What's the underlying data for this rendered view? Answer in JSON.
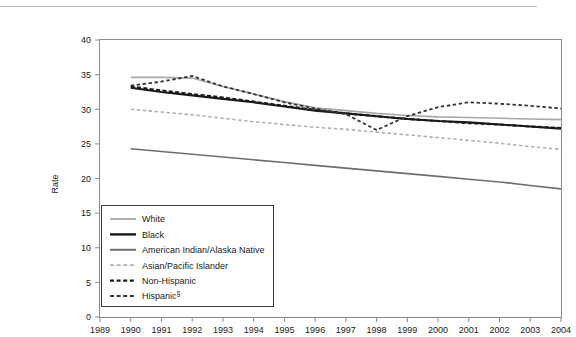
{
  "chart_data": {
    "type": "line",
    "title": "",
    "xlabel": "",
    "ylabel": "Rate",
    "xlim": [
      1989,
      2004
    ],
    "ylim": [
      0,
      40
    ],
    "yticks": [
      0,
      5,
      10,
      15,
      20,
      25,
      30,
      35,
      40
    ],
    "xticks": [
      1989,
      1990,
      1991,
      1992,
      1993,
      1994,
      1995,
      1996,
      1997,
      1998,
      1999,
      2000,
      2001,
      2002,
      2003,
      2004
    ],
    "grid": false,
    "legend_position": "lower-left-inside",
    "x": [
      1990,
      1991,
      1992,
      1993,
      1994,
      1995,
      1996,
      1997,
      1998,
      1999,
      2000,
      2001,
      2002,
      2003,
      2004
    ],
    "series": [
      {
        "name": "White",
        "color": "#a8a8a8",
        "style": "solid",
        "width": 1.6,
        "values": [
          34.6,
          34.6,
          34.5,
          33.3,
          32.2,
          31.1,
          30.2,
          29.8,
          29.4,
          29.1,
          28.9,
          28.8,
          28.7,
          28.6,
          28.5
        ]
      },
      {
        "name": "Black",
        "color": "#1a1a1a",
        "style": "solid",
        "width": 2.1,
        "values": [
          33.1,
          32.5,
          32.0,
          31.5,
          31.0,
          30.4,
          29.8,
          29.4,
          29.0,
          28.6,
          28.3,
          28.1,
          27.8,
          27.5,
          27.2
        ]
      },
      {
        "name": "American Indian/Alaska Native",
        "color": "#6e6e6e",
        "style": "solid",
        "width": 1.6,
        "values": [
          24.3,
          23.9,
          23.5,
          23.1,
          22.7,
          22.3,
          21.9,
          21.5,
          21.1,
          20.7,
          20.3,
          19.9,
          19.5,
          19.0,
          18.5
        ]
      },
      {
        "name": "Asian/Pacific Islander",
        "color": "#b0b0b0",
        "style": "dashed",
        "width": 1.6,
        "values": [
          30.0,
          29.6,
          29.2,
          28.7,
          28.2,
          27.8,
          27.4,
          27.1,
          26.7,
          26.3,
          25.9,
          25.5,
          25.1,
          24.6,
          24.2
        ]
      },
      {
        "name": "Non-Hispanic",
        "color": "#1a1a1a",
        "style": "dashed",
        "width": 2.1,
        "values": [
          33.3,
          32.7,
          32.2,
          31.7,
          31.1,
          30.5,
          29.9,
          29.4,
          29.0,
          28.6,
          28.3,
          28.0,
          27.8,
          27.5,
          27.3
        ]
      },
      {
        "name": "Hispanic§",
        "color": "#333333",
        "style": "dashed",
        "width": 1.8,
        "values": [
          33.4,
          34.0,
          34.8,
          33.3,
          32.2,
          31.0,
          30.1,
          29.3,
          27.0,
          29.0,
          30.3,
          31.0,
          30.8,
          30.5,
          30.1
        ]
      }
    ],
    "legend_entries": [
      {
        "label": "White",
        "color": "#a8a8a8",
        "style": "solid",
        "width": 1.8
      },
      {
        "label": "Black",
        "color": "#1a1a1a",
        "style": "solid",
        "width": 2.4
      },
      {
        "label": "American Indian/Alaska Native",
        "color": "#6e6e6e",
        "style": "solid",
        "width": 2.0
      },
      {
        "label": "Asian/Pacific Islander",
        "color": "#b0b0b0",
        "style": "dashed",
        "width": 1.8
      },
      {
        "label": "Non-Hispanic",
        "color": "#1a1a1a",
        "style": "dashed",
        "width": 2.4
      },
      {
        "label": "Hispanic§",
        "color": "#333333",
        "style": "dashed",
        "width": 2.0
      }
    ]
  }
}
